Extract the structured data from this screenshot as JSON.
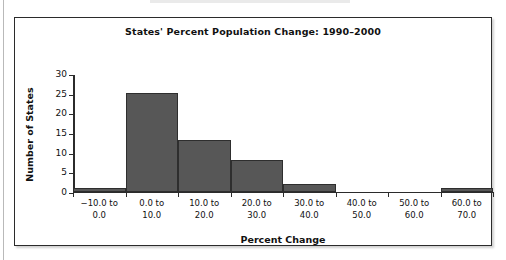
{
  "chart_data": {
    "type": "bar",
    "title": "States' Percent Population Change: 1990–2000",
    "xlabel": "Percent Change",
    "ylabel": "Number of States",
    "categories": [
      "−10.0 to 0.0",
      "0.0 to 10.0",
      "10.0 to 20.0",
      "20.0 to 30.0",
      "30.0 to 40.0",
      "40.0 to 50.0",
      "50.0 to 60.0",
      "60.0 to 70.0"
    ],
    "category_lines": [
      [
        "−10.0 to",
        "0.0"
      ],
      [
        "0.0 to",
        "10.0"
      ],
      [
        "10.0 to",
        "20.0"
      ],
      [
        "20.0 to",
        "30.0"
      ],
      [
        "30.0 to",
        "40.0"
      ],
      [
        "40.0 to",
        "50.0"
      ],
      [
        "50.0 to",
        "60.0"
      ],
      [
        "60.0 to",
        "70.0"
      ]
    ],
    "values": [
      1,
      25,
      13,
      8,
      2,
      0,
      0,
      1
    ],
    "ylim": [
      0,
      30
    ],
    "yticks": [
      0,
      5,
      10,
      15,
      20,
      25,
      30
    ],
    "ytick_labels": [
      "0",
      "5",
      "10",
      "15",
      "20",
      "25",
      "30"
    ],
    "grid": false,
    "legend": null,
    "bar_color": "#575757",
    "bar_edge_color": "#2e2e2e",
    "axis_color": "#2b2b2b",
    "background_color": "#ffffff"
  }
}
